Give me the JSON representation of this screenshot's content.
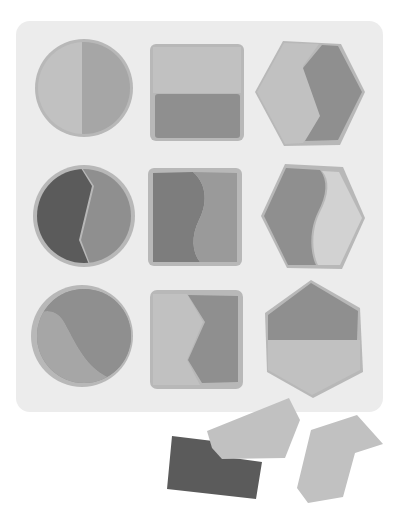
{
  "game": {
    "title": "Shape sorting puzzle",
    "board": {
      "x": 16,
      "y": 21,
      "width": 367,
      "height": 391,
      "radius": 14,
      "color": "#ececec",
      "rows": 3,
      "cols": 3
    },
    "colors": {
      "light": "#c1c1c1",
      "medium": "#a6a6a6",
      "mid_dark": "#8f8f8f",
      "dark": "#5b5b5b",
      "lightest": "#d2d2d2",
      "rim": "#b8b8b8"
    },
    "slots": [
      {
        "row": 0,
        "col": 0,
        "shape": "circle",
        "halves": [
          "light",
          "medium"
        ],
        "split": "vertical-straight"
      },
      {
        "row": 0,
        "col": 1,
        "shape": "square",
        "halves": [
          "light",
          "mid_dark"
        ],
        "split": "horizontal-straight"
      },
      {
        "row": 0,
        "col": 2,
        "shape": "hexagon",
        "halves": [
          "light",
          "mid_dark"
        ],
        "split": "chevron"
      },
      {
        "row": 1,
        "col": 0,
        "shape": "circle",
        "halves": [
          "dark",
          "mid_dark"
        ],
        "split": "chevron"
      },
      {
        "row": 1,
        "col": 1,
        "shape": "square",
        "halves": [
          "mid_dark",
          "medium"
        ],
        "split": "wave"
      },
      {
        "row": 1,
        "col": 2,
        "shape": "hexagon",
        "halves": [
          "mid_dark",
          "lightest"
        ],
        "split": "wave"
      },
      {
        "row": 2,
        "col": 0,
        "shape": "circle",
        "halves": [
          "medium",
          "mid_dark"
        ],
        "split": "wave-diagonal"
      },
      {
        "row": 2,
        "col": 1,
        "shape": "square",
        "halves": [
          "light",
          "mid_dark"
        ],
        "split": "chevron"
      },
      {
        "row": 2,
        "col": 2,
        "shape": "hexagon",
        "halves": [
          "mid_dark",
          "light"
        ],
        "split": "horizontal-straight"
      }
    ],
    "loose_pieces": [
      {
        "name": "loose-piece-dark-rectangle",
        "color": "dark",
        "points": "172,436 213,441 226,457 262,462 256,499 167,489"
      },
      {
        "name": "loose-piece-light-hexagon-half",
        "color": "light",
        "points": "207,431 289,398 300,420 285,458 222,459 212,448"
      },
      {
        "name": "loose-piece-light-hexagon-chevron",
        "color": "light",
        "points": "311,430 357,415 383,444 355,453 343,497 308,503 297,488"
      }
    ]
  }
}
